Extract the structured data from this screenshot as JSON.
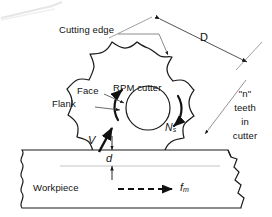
{
  "figure": {
    "type": "engineering-diagram",
    "background_color": "#ffffff",
    "line_color": "#1a1a1a",
    "artifact_color": "#e8e8e8"
  },
  "labels": {
    "cutting_edge": "Cutting edge",
    "face": "Face",
    "flank": "Flank",
    "rpm_cutter": "RPM cutter",
    "diameter": "D",
    "rotation_speed": "N",
    "rotation_speed_sub": "s",
    "velocity": "V",
    "depth_of_cut": "d",
    "workpiece": "Workpiece",
    "feed": "f",
    "feed_sub": "m",
    "teeth_line1": "\"n\"",
    "teeth_line2": "teeth",
    "teeth_line3": "in",
    "teeth_line4": "cutter"
  },
  "geometry": {
    "cutter_center_x": 148,
    "cutter_center_y": 110,
    "cutter_outer_radius": 62,
    "cutter_root_radius": 50,
    "cutter_hub_radius": 22,
    "teeth_count": 12,
    "workpiece_top_y": 150,
    "workpiece_bottom_y": 208,
    "depth_line_y": 166
  },
  "annotations": {
    "diameter_dimension": "D spans the cutter outside diameter on a diagonal",
    "rotation_arrows": "two curved arrows around hub indicating cutter rotation",
    "feed_arrow": "dashed horizontal arrow pointing right along workpiece",
    "velocity_arrow": "solid arrow at tooth tangent pointing up-right",
    "depth_arrows": "double-headed vertical dimension for depth of cut d",
    "break_lines": "wavy break lines at left and right ends of workpiece"
  }
}
